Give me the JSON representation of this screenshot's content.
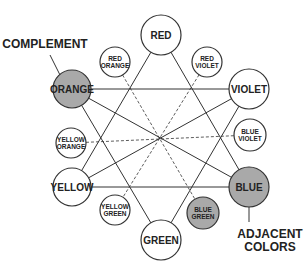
{
  "colors": {
    "line": "#333333",
    "highlight_fill": "#a9a9a9",
    "circle_fill": "#ffffff"
  },
  "nodes": [
    {
      "id": "red",
      "lines": [
        "RED"
      ],
      "x": 161,
      "y": 35,
      "r": 20,
      "size": "big",
      "highlight": false
    },
    {
      "id": "red-violet",
      "lines": [
        "RED",
        "VIOLET"
      ],
      "x": 207,
      "y": 62,
      "r": 15,
      "size": "small",
      "highlight": false
    },
    {
      "id": "violet",
      "lines": [
        "VIOLET"
      ],
      "x": 249,
      "y": 89,
      "r": 20,
      "size": "big",
      "highlight": false
    },
    {
      "id": "blue-violet",
      "lines": [
        "BLUE",
        "VIOLET"
      ],
      "x": 250,
      "y": 135,
      "r": 16,
      "size": "small",
      "highlight": false
    },
    {
      "id": "blue",
      "lines": [
        "BLUE"
      ],
      "x": 249,
      "y": 187,
      "r": 20,
      "size": "big",
      "highlight": true
    },
    {
      "id": "blue-green",
      "lines": [
        "BLUE",
        "GREEN"
      ],
      "x": 203,
      "y": 213,
      "r": 16,
      "size": "small",
      "highlight": true
    },
    {
      "id": "green",
      "lines": [
        "GREEN"
      ],
      "x": 161,
      "y": 240,
      "r": 20,
      "size": "big",
      "highlight": false
    },
    {
      "id": "yellow-green",
      "lines": [
        "YELLOW",
        "GREEN"
      ],
      "x": 115,
      "y": 210,
      "r": 15,
      "size": "small",
      "highlight": false
    },
    {
      "id": "yellow",
      "lines": [
        "YELLOW"
      ],
      "x": 72,
      "y": 187,
      "r": 19,
      "size": "big",
      "highlight": false
    },
    {
      "id": "yellow-orange",
      "lines": [
        "YELLOW",
        "ORANGE"
      ],
      "x": 71,
      "y": 143,
      "r": 15,
      "size": "small",
      "highlight": false
    },
    {
      "id": "orange",
      "lines": [
        "ORANGE"
      ],
      "x": 72,
      "y": 89,
      "r": 19,
      "size": "big",
      "highlight": true
    },
    {
      "id": "red-orange",
      "lines": [
        "RED",
        "ORANGE"
      ],
      "x": 115,
      "y": 62,
      "r": 15,
      "size": "small",
      "highlight": false
    }
  ],
  "center": {
    "x": 160,
    "y": 138
  },
  "solid_lines": [
    [
      "red",
      "yellow"
    ],
    [
      "red",
      "blue"
    ],
    [
      "yellow",
      "blue"
    ],
    [
      "orange",
      "violet"
    ],
    [
      "orange",
      "green"
    ],
    [
      "violet",
      "green"
    ],
    [
      "orange",
      "blue"
    ],
    [
      "yellow",
      "violet"
    ]
  ],
  "dashed_lines": [
    [
      "red-orange",
      "blue-green"
    ],
    [
      "red-violet",
      "yellow-green"
    ],
    [
      "yellow-orange",
      "blue-violet"
    ]
  ],
  "callouts": [
    {
      "id": "complement",
      "lines": [
        "COMPLEMENT"
      ],
      "x": 45,
      "y": 48,
      "target": [
        60,
        75
      ],
      "from": [
        50,
        55
      ]
    },
    {
      "id": "adjacent-colors",
      "lines": [
        "ADJACENT",
        "COLORS"
      ],
      "x": 270,
      "y": 238,
      "target": [
        249,
        207
      ],
      "from": [
        249,
        222
      ]
    }
  ]
}
